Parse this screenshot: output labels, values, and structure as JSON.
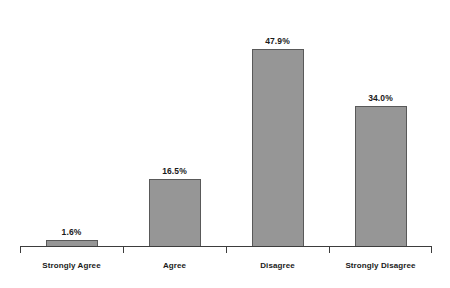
{
  "chart_data": {
    "type": "bar",
    "title": "",
    "subtitle": "",
    "xlabel": "",
    "ylabel": "",
    "ylim": [
      0,
      52
    ],
    "grid": false,
    "legend": false,
    "axis": {
      "x_axis_visible": true,
      "y_axis_visible": false,
      "tick_marks": 5
    },
    "categories": [
      "Strongly Agree",
      "Agree",
      "Disagree",
      "Strongly Disagree"
    ],
    "values": [
      1.6,
      16.5,
      47.9,
      34.0
    ],
    "data_labels": [
      "1.6%",
      "16.5%",
      "47.9%",
      "34.0%"
    ],
    "colors": {
      "bar_fill": "#969696",
      "bar_border": "#595959",
      "axis": "#3d3d3d",
      "text": "#1a1a1a",
      "background": "#ffffff"
    }
  }
}
